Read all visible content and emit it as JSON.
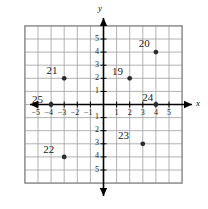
{
  "chart_data": {
    "type": "scatter",
    "title": "",
    "xlabel": "x",
    "ylabel": "y",
    "xlim": [
      -6,
      6
    ],
    "ylim": [
      -6,
      6
    ],
    "grid": true,
    "legend": "none",
    "xticks": [
      "-5",
      "-4",
      "-3",
      "-2",
      "-1",
      "1",
      "2",
      "3",
      "4",
      "5"
    ],
    "xtick_values": [
      -5,
      -4,
      -3,
      -2,
      -1,
      1,
      2,
      3,
      4,
      5
    ],
    "yticks": [
      "5",
      "4",
      "3",
      "2",
      "1",
      "1",
      "2",
      "3",
      "4",
      "5"
    ],
    "ytick_values": [
      5,
      4,
      3,
      2,
      1,
      -1,
      -2,
      -3,
      -4,
      -5
    ],
    "points": [
      {
        "label": "19",
        "x": 2,
        "y": 2,
        "label_dx": -1.35,
        "label_dy": 0.95
      },
      {
        "label": "20",
        "x": 4,
        "y": 4,
        "label_dx": -1.3,
        "label_dy": 1.05
      },
      {
        "label": "21",
        "x": -3,
        "y": 2,
        "label_dx": -1.35,
        "label_dy": 1.0
      },
      {
        "label": "22",
        "x": -3,
        "y": -4,
        "label_dx": -1.6,
        "label_dy": 1.0
      },
      {
        "label": "23",
        "x": 3,
        "y": -3,
        "label_dx": -1.9,
        "label_dy": 1.05
      },
      {
        "label": "24",
        "x": 4,
        "y": 0,
        "label_dx": -1.05,
        "label_dy": 0.95
      },
      {
        "label": "25",
        "x": -4,
        "y": 0,
        "label_dx": -1.45,
        "label_dy": 0.8
      }
    ]
  },
  "colors": {
    "grid": "#a9a9a9",
    "grid_outer": "#8c8c8c",
    "axis": "#000000",
    "point": "#2b2b2b",
    "text": "#1b1b1b"
  },
  "axes": {
    "x_axis_name": "x",
    "y_axis_name": "y"
  }
}
